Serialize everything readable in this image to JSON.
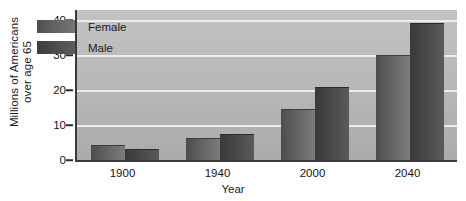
{
  "chart_data": {
    "type": "bar",
    "title": "",
    "xlabel": "Year",
    "ylabel_line1": "Millions of Americans",
    "ylabel_line2": "over age 65",
    "categories": [
      "1900",
      "1940",
      "2000",
      "2040"
    ],
    "series": [
      {
        "name": "Female",
        "values": [
          4.2,
          6.4,
          14.6,
          30.0
        ]
      },
      {
        "name": "Male",
        "values": [
          3.3,
          7.5,
          21.0,
          39.2
        ]
      }
    ],
    "ylim": [
      0,
      43
    ],
    "yticks": [
      0,
      10,
      20,
      30,
      40
    ],
    "ytick_labels": [
      "0",
      "10",
      "20",
      "30",
      "40"
    ],
    "grid": true,
    "legend_position": "upper-left-inside",
    "colors": {
      "female": "#606060",
      "male": "#424242",
      "plot_background": "#b9b9b9",
      "gridline": "#ededed",
      "axis": "#3a3a3a",
      "text": "#1b1b1b"
    }
  }
}
